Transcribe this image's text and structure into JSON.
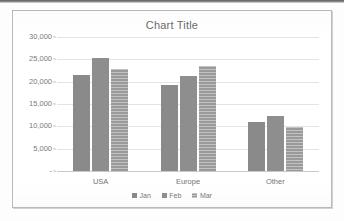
{
  "chart_data": {
    "type": "bar",
    "title": "Chart Title",
    "xlabel": "",
    "ylabel": "",
    "categories": [
      "USA",
      "Europe",
      "Other"
    ],
    "series": [
      {
        "name": "Jan",
        "values": [
          21400,
          19200,
          11000
        ],
        "color": "#8a8a8a"
      },
      {
        "name": "Feb",
        "values": [
          25300,
          21300,
          12300
        ],
        "color": "#8e8e8e"
      },
      {
        "name": "Mar",
        "values": [
          22800,
          23600,
          9800
        ],
        "color": "#9a9a9a"
      }
    ],
    "ylim": [
      0,
      30000
    ],
    "ytick_values": [
      0,
      5000,
      10000,
      15000,
      20000,
      25000,
      30000
    ],
    "ytick_labels": [
      "-",
      " 5,000",
      "10,000",
      "15,000",
      "20,000",
      "25,000",
      "30,000"
    ],
    "grid": true,
    "legend_position": "bottom"
  },
  "legend": {
    "items": [
      {
        "label": "Jan"
      },
      {
        "label": "Feb"
      },
      {
        "label": "Mar"
      }
    ]
  }
}
